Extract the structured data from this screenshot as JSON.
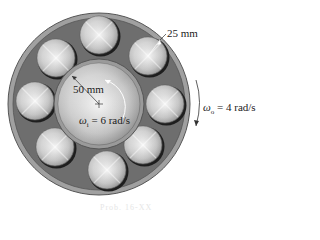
{
  "figure": {
    "type": "roller bearing diagram",
    "roller_count": 8,
    "colors": {
      "outer_race": "#8a8a8a",
      "cage": "#707070",
      "metal_light": "#e8e8e8",
      "metal_dark": "#8c8c8c",
      "text": "#222222"
    }
  },
  "labels": {
    "roller_radius": "25 mm",
    "inner_radius": "50 mm",
    "omega_inner": "ω",
    "omega_inner_sub": "i",
    "omega_inner_value": " = 6 rad/s",
    "omega_outer": "ω",
    "omega_outer_sub": "o",
    "omega_outer_value": " = 4 rad/s"
  },
  "caption": "Prob. 16-XX"
}
